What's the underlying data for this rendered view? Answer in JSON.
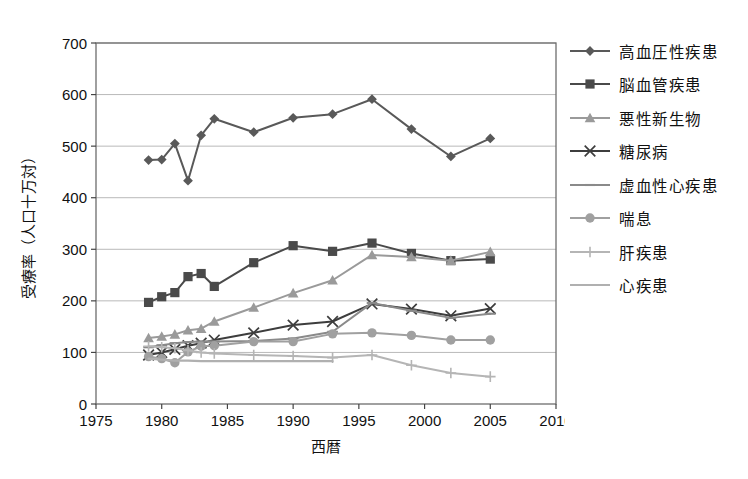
{
  "chart_data": {
    "type": "line",
    "title": "",
    "xlabel": "西暦",
    "ylabel": "受療率（人口十万対）",
    "xlim": [
      1975,
      2010
    ],
    "ylim": [
      0,
      700
    ],
    "xticks": [
      1975,
      1980,
      1985,
      1990,
      1995,
      2000,
      2005,
      2010
    ],
    "yticks": [
      0,
      100,
      200,
      300,
      400,
      500,
      600,
      700
    ],
    "grid": true,
    "legend_position": "right",
    "x": [
      1979,
      1980,
      1981,
      1982,
      1983,
      1984,
      1987,
      1990,
      1993,
      1996,
      1999,
      2002,
      2005
    ],
    "series": [
      {
        "name": "高血圧性疾患",
        "marker": "diamond",
        "color": "#595959",
        "values": [
          473,
          474,
          505,
          433,
          521,
          553,
          527,
          555,
          562,
          591,
          533,
          480,
          515
        ]
      },
      {
        "name": "脳血管疾患",
        "marker": "square",
        "color": "#4a4a4a",
        "values": [
          197,
          208,
          216,
          247,
          253,
          228,
          274,
          307,
          296,
          312,
          292,
          278,
          281
        ]
      },
      {
        "name": "悪性新生物",
        "marker": "triangle",
        "color": "#9a9a9a",
        "values": [
          128,
          131,
          135,
          143,
          146,
          160,
          187,
          215,
          240,
          289,
          285,
          278,
          295
        ]
      },
      {
        "name": "糖尿病",
        "marker": "cross",
        "color": "#3d3d3d",
        "values": [
          95,
          100,
          106,
          113,
          118,
          124,
          138,
          153,
          160,
          194,
          184,
          171,
          185
        ]
      },
      {
        "name": "虚血性心疾患",
        "marker": "dash",
        "color": "#8a8a8a",
        "values": [
          110,
          114,
          118,
          120,
          121,
          121,
          122,
          127,
          140,
          196,
          181,
          167,
          175
        ]
      },
      {
        "name": "喘息",
        "marker": "circle",
        "color": "#a0a0a0",
        "values": [
          92,
          88,
          80,
          101,
          112,
          113,
          121,
          121,
          136,
          138,
          133,
          124,
          124
        ]
      },
      {
        "name": "肝疾患",
        "marker": "plus",
        "color": "#b5b5b5",
        "values": [
          112,
          110,
          108,
          104,
          100,
          98,
          95,
          93,
          90,
          95,
          75,
          60,
          53
        ]
      },
      {
        "name": "心疾患",
        "marker": "none",
        "color": "#b0b0b0",
        "values": [
          88,
          86,
          84,
          84,
          83,
          83,
          83,
          83,
          83,
          null,
          null,
          null,
          null
        ]
      }
    ]
  }
}
